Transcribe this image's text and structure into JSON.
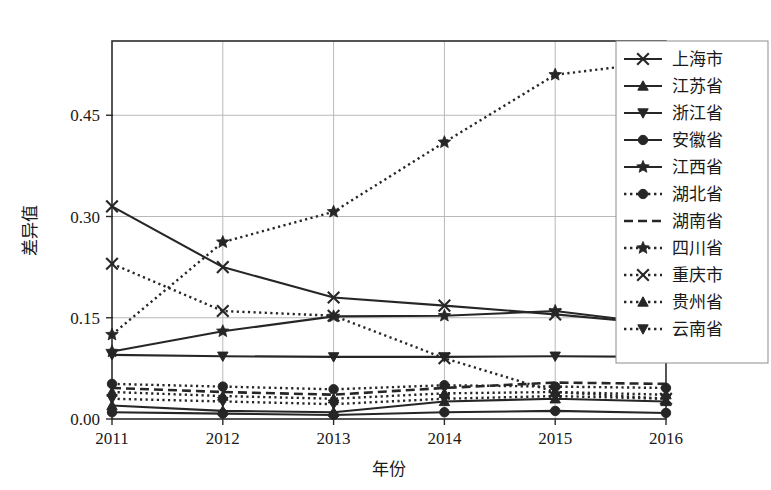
{
  "chart_data": {
    "type": "line",
    "title": "",
    "xlabel": "年份",
    "ylabel": "差异值",
    "x": [
      "2011",
      "2012",
      "2013",
      "2014",
      "2015",
      "2016"
    ],
    "xlim": [
      2011,
      2016
    ],
    "ylim": [
      0.0,
      0.56
    ],
    "yticks": [
      0.0,
      0.15,
      0.3,
      0.45
    ],
    "ytick_labels": [
      "0.00",
      "0.15",
      "0.30",
      "0.45"
    ],
    "grid": "horizontal-and-vertical",
    "legend_position": "right-outside-top",
    "series": [
      {
        "name": "上海市",
        "marker": "x",
        "linestyle": "solid",
        "values": [
          0.315,
          0.225,
          0.18,
          0.168,
          0.155,
          0.14
        ]
      },
      {
        "name": "江苏省",
        "marker": "triangle-up",
        "linestyle": "solid",
        "values": [
          0.02,
          0.012,
          0.01,
          0.026,
          0.03,
          0.026
        ]
      },
      {
        "name": "浙江省",
        "marker": "triangle-down",
        "linestyle": "solid",
        "values": [
          0.095,
          0.093,
          0.092,
          0.092,
          0.093,
          0.092
        ]
      },
      {
        "name": "安徽省",
        "marker": "circle",
        "linestyle": "solid",
        "values": [
          0.01,
          0.008,
          0.006,
          0.01,
          0.012,
          0.009
        ]
      },
      {
        "name": "江西省",
        "marker": "star",
        "linestyle": "solid",
        "values": [
          0.1,
          0.13,
          0.152,
          0.153,
          0.16,
          0.14
        ]
      },
      {
        "name": "湖北省",
        "marker": "circle",
        "linestyle": "dotted",
        "values": [
          0.052,
          0.048,
          0.044,
          0.05,
          0.048,
          0.046
        ]
      },
      {
        "name": "湖南省",
        "marker": "none",
        "linestyle": "dashed",
        "values": [
          0.046,
          0.04,
          0.036,
          0.046,
          0.054,
          0.052
        ]
      },
      {
        "name": "四川省",
        "marker": "star",
        "linestyle": "dotted",
        "values": [
          0.125,
          0.262,
          0.307,
          0.41,
          0.51,
          0.53
        ]
      },
      {
        "name": "重庆市",
        "marker": "x",
        "linestyle": "dotted",
        "values": [
          0.23,
          0.16,
          0.153,
          0.09,
          0.04,
          0.03
        ]
      },
      {
        "name": "贵州省",
        "marker": "triangle-up",
        "linestyle": "dotted",
        "values": [
          0.04,
          0.034,
          0.03,
          0.038,
          0.04,
          0.036
        ]
      },
      {
        "name": "云南省",
        "marker": "triangle-down",
        "linestyle": "dotted",
        "values": [
          0.03,
          0.026,
          0.022,
          0.03,
          0.034,
          0.03
        ]
      }
    ]
  },
  "plot": {
    "left": 112,
    "right": 666,
    "top": 41,
    "bottom": 419
  },
  "legend": {
    "x": 616,
    "y": 41,
    "width": 152,
    "height": 322,
    "row_height": 27
  },
  "colors": {
    "ink": "#262626",
    "grid": "#b9b9b9",
    "frame": "#2b2b2b",
    "background": "#ffffff"
  }
}
